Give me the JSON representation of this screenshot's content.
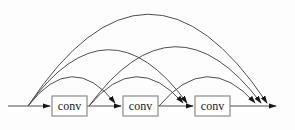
{
  "diagram": {
    "canvas": {
      "width": 295,
      "height": 130,
      "background": "#fdfdfd"
    },
    "style": {
      "line_color": "#4f4f4f",
      "arrowhead_color": "#161616",
      "box_fill": "#fefefe",
      "box_border": "#8c8c8c",
      "label_color": "#1a1a1a",
      "label_font_size": 12
    },
    "nodes": [
      {
        "id": "conv1",
        "label": "conv",
        "x": 52,
        "y": 96,
        "w": 35,
        "h": 20
      },
      {
        "id": "conv2",
        "label": "conv",
        "x": 123,
        "y": 96,
        "w": 35,
        "h": 20
      },
      {
        "id": "conv3",
        "label": "conv",
        "x": 195,
        "y": 96,
        "w": 35,
        "h": 20
      }
    ],
    "main_arrows": [
      {
        "name": "input-arrow",
        "from": [
          8,
          106
        ],
        "to": [
          50,
          106
        ]
      },
      {
        "name": "conv1-conv2-arrow",
        "from": [
          87,
          106
        ],
        "to": [
          121,
          106
        ]
      },
      {
        "name": "conv2-conv3-arrow",
        "from": [
          158,
          106
        ],
        "to": [
          193,
          106
        ]
      },
      {
        "name": "output-arrow",
        "from": [
          230,
          106
        ],
        "to": [
          276,
          106
        ]
      }
    ],
    "skip_connections": [
      {
        "from": "input",
        "to": "output",
        "start": [
          28,
          106
        ],
        "control": [
          148,
          -76
        ],
        "end": [
          267,
          103
        ]
      },
      {
        "from": "input",
        "to": "conv3-input",
        "start": [
          28,
          106
        ],
        "control": [
          108,
          -5
        ],
        "end": [
          187,
          103
        ]
      },
      {
        "from": "input",
        "to": "conv2-input",
        "start": [
          28,
          106
        ],
        "control": [
          72,
          49
        ],
        "end": [
          115,
          103
        ]
      },
      {
        "from": "conv1-output",
        "to": "output",
        "start": [
          89,
          106
        ],
        "control": [
          175,
          -11
        ],
        "end": [
          261,
          103
        ]
      },
      {
        "from": "conv1-output",
        "to": "conv3-input",
        "start": [
          89,
          106
        ],
        "control": [
          136,
          49
        ],
        "end": [
          183,
          103
        ]
      },
      {
        "from": "conv2-output",
        "to": "output",
        "start": [
          159,
          106
        ],
        "control": [
          207,
          49
        ],
        "end": [
          255,
          103
        ]
      }
    ]
  }
}
